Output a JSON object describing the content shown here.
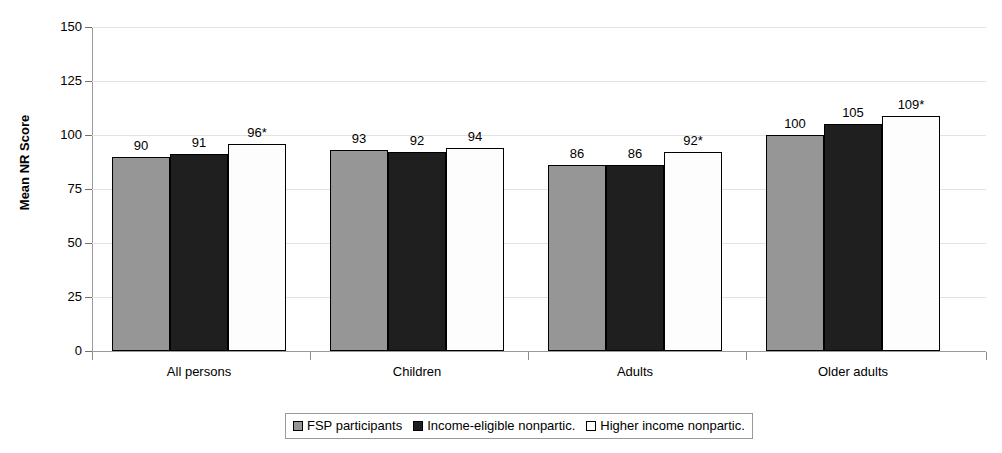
{
  "chart_data": {
    "type": "bar",
    "title": "",
    "xlabel": "",
    "ylabel": "Mean NR Score",
    "ylim": [
      0,
      150
    ],
    "yticks": [
      "0",
      "25",
      "50",
      "75",
      "100",
      "125",
      "150"
    ],
    "grid": true,
    "legend_position": "bottom",
    "categories": [
      "All persons",
      "Children",
      "Adults",
      "Older adults"
    ],
    "series": [
      {
        "name": "FSP participants",
        "color": "#969696",
        "values": [
          90,
          93,
          86,
          100
        ],
        "labels": [
          "90",
          "93",
          "86",
          "100"
        ]
      },
      {
        "name": "Income-eligible nonpartic.",
        "color": "#1f1f1f",
        "values": [
          91,
          92,
          86,
          105
        ],
        "labels": [
          "91",
          "92",
          "86",
          "105"
        ]
      },
      {
        "name": "Higher income nonpartic.",
        "color": "#ffffff",
        "values": [
          96,
          94,
          92,
          109
        ],
        "labels": [
          "96*",
          "94",
          "92*",
          "109*"
        ]
      }
    ]
  },
  "axis": {
    "y_title": "Mean NR Score"
  },
  "legend": {
    "items": [
      {
        "label": "FSP participants",
        "swatch": "s0"
      },
      {
        "label": "Income-eligible nonpartic.",
        "swatch": "s1"
      },
      {
        "label": "Higher income nonpartic.",
        "swatch": "s2"
      }
    ]
  }
}
